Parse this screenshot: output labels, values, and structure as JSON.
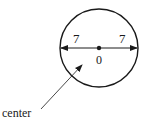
{
  "diagram": {
    "type": "circle-diameter",
    "labels": {
      "left_radius": "7",
      "right_radius": "7",
      "center_value": "0",
      "pointer_label": "center"
    },
    "colors": {
      "stroke": "#1a1a1a",
      "background": "#ffffff"
    }
  }
}
